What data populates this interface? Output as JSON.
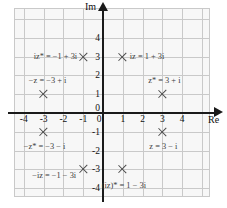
{
  "chart_data": {
    "type": "scatter",
    "title": "",
    "xlabel": "Re",
    "ylabel": "Im",
    "xlim": [
      -5,
      5
    ],
    "ylim": [
      -4.8,
      4.8
    ],
    "grid": true,
    "legend": "none",
    "x_ticks": [
      "-4",
      "-3",
      "-2",
      "-1",
      "0",
      "1",
      "2",
      "3",
      "4"
    ],
    "x_tick_values": [
      -4,
      -3,
      -2,
      -1,
      0,
      1,
      2,
      3,
      4
    ],
    "y_ticks": [
      "4",
      "3",
      "2",
      "1",
      "0",
      "-1",
      "-2",
      "-3",
      "-4"
    ],
    "y_tick_values": [
      4,
      3,
      2,
      1,
      0,
      -1,
      -2,
      -3,
      -4
    ],
    "points": [
      {
        "label": "iz* = −1 + 3i",
        "x": -1,
        "y": 3
      },
      {
        "label": "iz = 1 + 3i",
        "x": 1,
        "y": 3
      },
      {
        "label": "−z = −3 + i",
        "x": -3,
        "y": 1
      },
      {
        "label": "z* = 3 + i",
        "x": 3,
        "y": 1
      },
      {
        "label": "−z* = −3 − i",
        "x": -3,
        "y": -1
      },
      {
        "label": "z = 3 − i",
        "x": 3,
        "y": -1
      },
      {
        "label": "−iz = −1 − 3i",
        "x": -1,
        "y": -3
      },
      {
        "label": "(iz)* = 1 − 3i",
        "x": 1,
        "y": -3
      }
    ]
  },
  "axes": {
    "re_label": "Re",
    "im_label": "Im"
  },
  "colors": {
    "panel_background": "#f7f7f7",
    "grid": "#c9c9c9",
    "axis": "#1a1a1a",
    "marker": "#4a4a4a",
    "annotation_text": "#3d3d3d",
    "tick_text": "#111111"
  }
}
